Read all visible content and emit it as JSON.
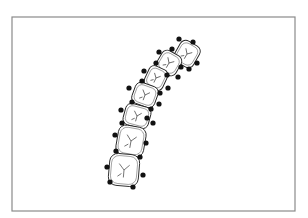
{
  "figure": {
    "frame": {
      "x": 12,
      "y": 17,
      "width": 283,
      "height": 194,
      "stroke": "#8a8a8a"
    },
    "landmark_color": "#111111",
    "outline_color": "#222222",
    "teeth": [
      {
        "name": "incisor-lateral",
        "cx": 187,
        "cy": 54,
        "rx": 11,
        "ry": 12,
        "rot": 30
      },
      {
        "name": "canine",
        "cx": 169,
        "cy": 63,
        "rx": 11,
        "ry": 11,
        "rot": 30
      },
      {
        "name": "premolar-first",
        "cx": 156,
        "cy": 78,
        "rx": 10,
        "ry": 11,
        "rot": 25
      },
      {
        "name": "premolar-second",
        "cx": 145,
        "cy": 95,
        "rx": 12,
        "ry": 11,
        "rot": 20
      },
      {
        "name": "molar-first",
        "cx": 137,
        "cy": 116,
        "rx": 13,
        "ry": 11,
        "rot": 15
      },
      {
        "name": "molar-second",
        "cx": 131,
        "cy": 141,
        "rx": 14,
        "ry": 15,
        "rot": 10
      },
      {
        "name": "molar-third",
        "cx": 124,
        "cy": 170,
        "rx": 15,
        "ry": 16,
        "rot": 5
      }
    ],
    "landmarks": [
      [
        179,
        39
      ],
      [
        193,
        42
      ],
      [
        159,
        52
      ],
      [
        172,
        49
      ],
      [
        197,
        63
      ],
      [
        189,
        69
      ],
      [
        181,
        67
      ],
      [
        156,
        63
      ],
      [
        144,
        71
      ],
      [
        178,
        77
      ],
      [
        167,
        75
      ],
      [
        142,
        81
      ],
      [
        129,
        88
      ],
      [
        168,
        88
      ],
      [
        160,
        93
      ],
      [
        132,
        102
      ],
      [
        159,
        104
      ],
      [
        121,
        110
      ],
      [
        151,
        109
      ],
      [
        122,
        123
      ],
      [
        147,
        118
      ],
      [
        153,
        123
      ],
      [
        115,
        135
      ],
      [
        146,
        143
      ],
      [
        116,
        151
      ],
      [
        140,
        157
      ],
      [
        107,
        167
      ],
      [
        143,
        175
      ],
      [
        110,
        182
      ],
      [
        133,
        187
      ]
    ]
  }
}
